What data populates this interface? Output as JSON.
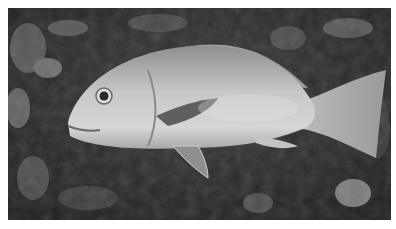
{
  "caption": {
    "text": "",
    "note": "partially cropped, illegible"
  },
  "photo": {
    "subject": "fish",
    "scene": "reef",
    "grayscale": true,
    "colors": {
      "background_dark": "#2e2e2e",
      "fish_body": "#b4b4b4",
      "fish_highlight": "#dadada",
      "reef_light": "#9a9a9a"
    }
  }
}
